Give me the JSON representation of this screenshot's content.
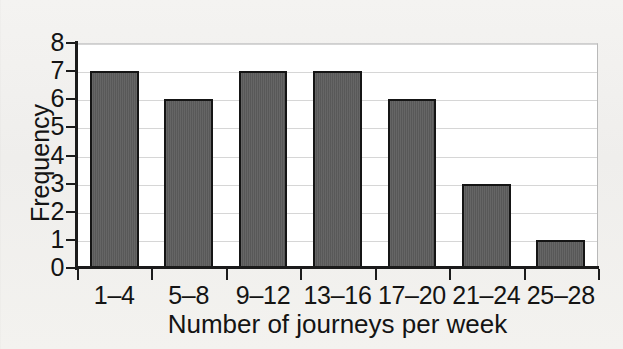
{
  "chart_data": {
    "type": "bar",
    "title": "",
    "subtitle": "",
    "categories": [
      "1–4",
      "5–8",
      "9–12",
      "13–16",
      "17–20",
      "21–24",
      "25–28"
    ],
    "values": [
      7,
      6,
      7,
      7,
      6,
      3,
      1
    ],
    "xlabel": "Number of journeys per week",
    "ylabel": "Frequency",
    "ylim": [
      0,
      8
    ],
    "ytick_labels": [
      "8",
      "7",
      "6",
      "5",
      "4",
      "3",
      "2",
      "1",
      "0"
    ],
    "ytick_values": [
      8,
      7,
      6,
      5,
      4,
      3,
      2,
      1,
      0
    ],
    "grid": true,
    "grid_axis": "y",
    "legend": false,
    "legend_position": "none",
    "annotations": [],
    "colors": {
      "bar_fill": "#5c5c5c",
      "bar_edge": "#151515",
      "gridline": "#d6d6d6",
      "axis": "#1b1b1b",
      "plot_background": "#ffffff",
      "page_background": "#f3f2f0",
      "text": "#141414"
    }
  }
}
